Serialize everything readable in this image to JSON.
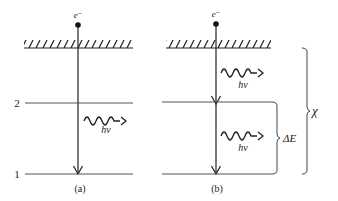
{
  "diagram": {
    "type": "energy-level diagram",
    "panels": [
      {
        "id": "a",
        "label": "(a)",
        "electron_label": "e⁻",
        "photons": [
          {
            "label": "hν",
            "between": "level 2 and level 1"
          }
        ]
      },
      {
        "id": "b",
        "label": "(b)",
        "electron_label": "e⁻",
        "photons": [
          {
            "label": "hν",
            "between": "surface and level 2"
          },
          {
            "label": "hν",
            "between": "level 2 and level 1"
          }
        ]
      }
    ],
    "levels": [
      {
        "label": "2"
      },
      {
        "label": "1"
      }
    ],
    "braces": {
      "delta_e": "ΔE",
      "chi": "χ"
    },
    "colors": {
      "line": "#222222",
      "background": "#ffffff"
    }
  }
}
